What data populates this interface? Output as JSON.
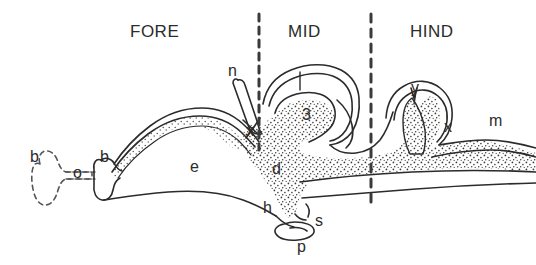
{
  "figure": {
    "background_color": "#ffffff",
    "ink_color": "#2b2b2b"
  },
  "region_labels": [
    {
      "id": "fore",
      "text": "FORE",
      "x": 130,
      "y": 22
    },
    {
      "id": "mid",
      "text": "MID",
      "x": 288,
      "y": 22
    },
    {
      "id": "hind",
      "text": "HIND",
      "x": 410,
      "y": 22
    }
  ],
  "divider_lines": [
    {
      "id": "fore-mid-divider",
      "x": 259,
      "y1": 14,
      "y2": 150,
      "dash": "7,6",
      "width": 3
    },
    {
      "id": "mid-hind-divider",
      "x": 371,
      "y1": 14,
      "y2": 205,
      "dash": "8,7",
      "width": 3
    }
  ],
  "part_labels": [
    {
      "id": "olfactory-bulb-outline",
      "text": "b",
      "x": 30,
      "y": 148
    },
    {
      "id": "olfactory-tract",
      "text": "o",
      "x": 73,
      "y": 164
    },
    {
      "id": "olfactory-bulb",
      "text": "b",
      "x": 100,
      "y": 148
    },
    {
      "id": "cerebral-hemisphere",
      "text": "e",
      "x": 190,
      "y": 158
    },
    {
      "id": "optic-nerve",
      "text": "n",
      "x": 228,
      "y": 62
    },
    {
      "id": "optic-chiasma",
      "text": "x",
      "x": 246,
      "y": 122
    },
    {
      "id": "third-ventricle",
      "text": "3",
      "x": 302,
      "y": 106
    },
    {
      "id": "diencephalon",
      "text": "d",
      "x": 272,
      "y": 160
    },
    {
      "id": "hypothalamus",
      "text": "h",
      "x": 263,
      "y": 199
    },
    {
      "id": "infundibulum",
      "text": "s",
      "x": 315,
      "y": 212
    },
    {
      "id": "pituitary",
      "text": "p",
      "x": 297,
      "y": 238
    },
    {
      "id": "cerebellum",
      "text": "y",
      "x": 411,
      "y": 79
    },
    {
      "id": "fourth-ventricle",
      "text": "x",
      "x": 444,
      "y": 118
    },
    {
      "id": "medulla",
      "text": "m",
      "x": 489,
      "y": 112
    }
  ],
  "leader_ticks": [
    {
      "id": "third-ventricle-leader",
      "x1": 300,
      "y1": 72,
      "x2": 300,
      "y2": 90
    },
    {
      "id": "fourth-ventricle-leader",
      "x1": 418,
      "y1": 92,
      "x2": 415,
      "y2": 104
    }
  ],
  "shapes": {
    "stipple_fill": "dotted-grey",
    "dashed_outline": "olfactory-bulb-absent"
  }
}
